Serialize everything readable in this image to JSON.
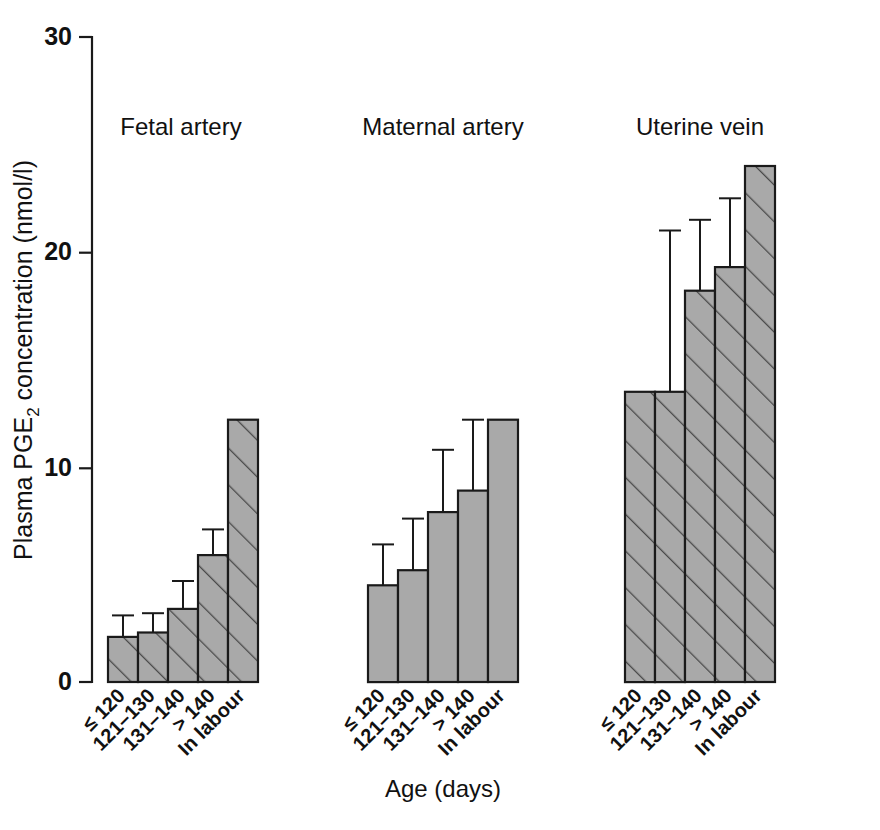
{
  "chart_data": {
    "type": "bar",
    "title": "",
    "subtitle": "",
    "xlabel": "Age (days)",
    "ylabel": "Plasma PGE2 concentration (nmol/l)",
    "ylabel_parts": {
      "pre": "Plasma PGE",
      "sub": "2",
      "post": " concentration (nmol/l)"
    },
    "ylim": [
      0,
      30
    ],
    "yticks": [
      0,
      10,
      20,
      30
    ],
    "ytick_labels": [
      "0",
      "10",
      "20",
      "30"
    ],
    "grid": false,
    "legend_position": "none",
    "categories": [
      "≤ 120",
      "121–130",
      "131–140",
      "> 140",
      "In labour"
    ],
    "panels": [
      {
        "name": "Fetal artery",
        "fill_style": "hatched",
        "values": [
          2.1,
          2.3,
          3.4,
          5.9,
          12.2
        ],
        "errors": [
          1.0,
          0.9,
          1.3,
          1.2,
          null
        ]
      },
      {
        "name": "Maternal artery",
        "fill_style": "solid",
        "values": [
          4.5,
          5.2,
          7.9,
          8.9,
          12.2
        ],
        "errors": [
          1.9,
          2.4,
          2.9,
          3.3,
          null
        ]
      },
      {
        "name": "Uterine vein",
        "fill_style": "hatched",
        "values": [
          13.5,
          13.5,
          18.2,
          19.3,
          24.0
        ],
        "errors": [
          null,
          7.5,
          3.3,
          3.2,
          null
        ]
      }
    ],
    "colors": {
      "bar_fill": "#a9a9a9",
      "bar_outline": "#1a1a1a",
      "hatch": "#4a4a4a",
      "axis": "#1a1a1a",
      "text": "#111111",
      "background": "#ffffff"
    }
  },
  "axes": {
    "y_tick_0": "0",
    "y_tick_10": "10",
    "y_tick_20": "20",
    "y_tick_30": "30"
  },
  "panel_titles": {
    "fetal": "Fetal artery",
    "maternal": "Maternal artery",
    "uterine": "Uterine vein"
  },
  "category_labels": {
    "c0": "≤ 120",
    "c1": "121–130",
    "c2": "131–140",
    "c3": "> 140",
    "c4": "In labour"
  },
  "titles": {
    "x_axis": "Age (days)",
    "y_axis_pre": "Plasma PGE",
    "y_axis_sub": "2",
    "y_axis_post": " concentration (nmol/l)"
  }
}
